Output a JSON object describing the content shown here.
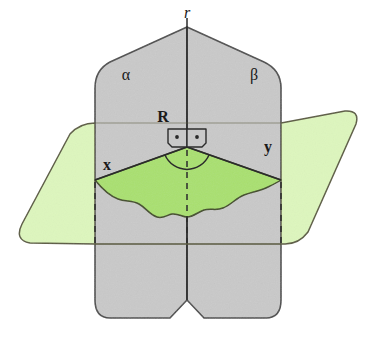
{
  "figure": {
    "type": "geometry-diagram"
  },
  "labels": {
    "edge_r": "r",
    "half_plane_alpha": "α",
    "half_plane_beta": "β",
    "plane_R": "R",
    "ray_x": "x",
    "ray_y": "y"
  },
  "colors": {
    "vertical_plane_fill": "#c9c9c9",
    "vertical_plane_stroke": "#4a4a4a",
    "horizontal_plane_fill": "#ddf6bd",
    "horizontal_plane_stroke": "#5a5a40",
    "sector_fill": "#a9e06f",
    "sector_stroke": "#3f4a22",
    "line_color": "#2b2b2b",
    "background": "#ffffff",
    "text_color": "#1a1a1a"
  },
  "markers": {
    "right_angle_left": "right-angle-square-with-dot",
    "right_angle_right": "right-angle-square-with-dot",
    "dihedral_arc": "angle-arc",
    "hidden_edges": "dashed-lines"
  },
  "geometry": {
    "apex": {
      "x": 187,
      "y": 147
    },
    "top_vertex": {
      "x": 187,
      "y": 27
    },
    "ray_x_end": {
      "x": 95,
      "y": 180
    },
    "ray_y_end": {
      "x": 281,
      "y": 180
    },
    "dashed_left_x": 95,
    "dashed_center_x": 187,
    "dashed_right_x": 281,
    "dashed_top_y": 180,
    "dashed_bottom_y": 245
  }
}
